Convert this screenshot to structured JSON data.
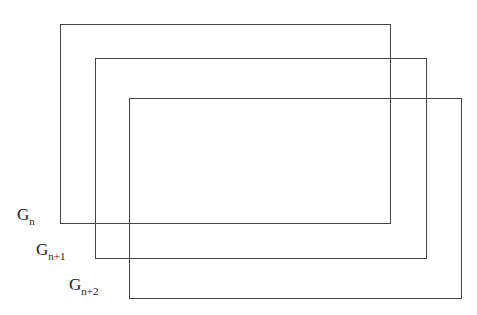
{
  "diagram": {
    "type": "overlapping-rectangles",
    "stroke_color": "#444444",
    "background": "#ffffff",
    "rectangles": [
      {
        "id": "Gn",
        "label_main": "G",
        "label_sub": "n",
        "left": 60,
        "top": 24,
        "width": 331,
        "height": 200
      },
      {
        "id": "Gn+1",
        "label_main": "G",
        "label_sub": "n+1",
        "left": 95,
        "top": 58,
        "width": 332,
        "height": 201
      },
      {
        "id": "Gn+2",
        "label_main": "G",
        "label_sub": "n+2",
        "left": 129,
        "top": 98,
        "width": 333,
        "height": 201
      }
    ]
  }
}
